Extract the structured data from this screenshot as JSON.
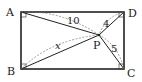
{
  "diagram": {
    "type": "geometry",
    "shape": "rectangle",
    "vertices": {
      "A": {
        "label": "A"
      },
      "B": {
        "label": "B"
      },
      "C": {
        "label": "C"
      },
      "D": {
        "label": "D"
      }
    },
    "point": {
      "label": "P"
    },
    "segments": {
      "AP": {
        "label": "10"
      },
      "DP": {
        "label": "4"
      },
      "BP": {
        "label": "x"
      },
      "CP": {
        "label": "5"
      }
    },
    "right_angles": [
      "A",
      "B",
      "C",
      "D"
    ],
    "colors": {
      "stroke": "#222222",
      "dashed": "#777777",
      "background": "#ffffff"
    }
  }
}
